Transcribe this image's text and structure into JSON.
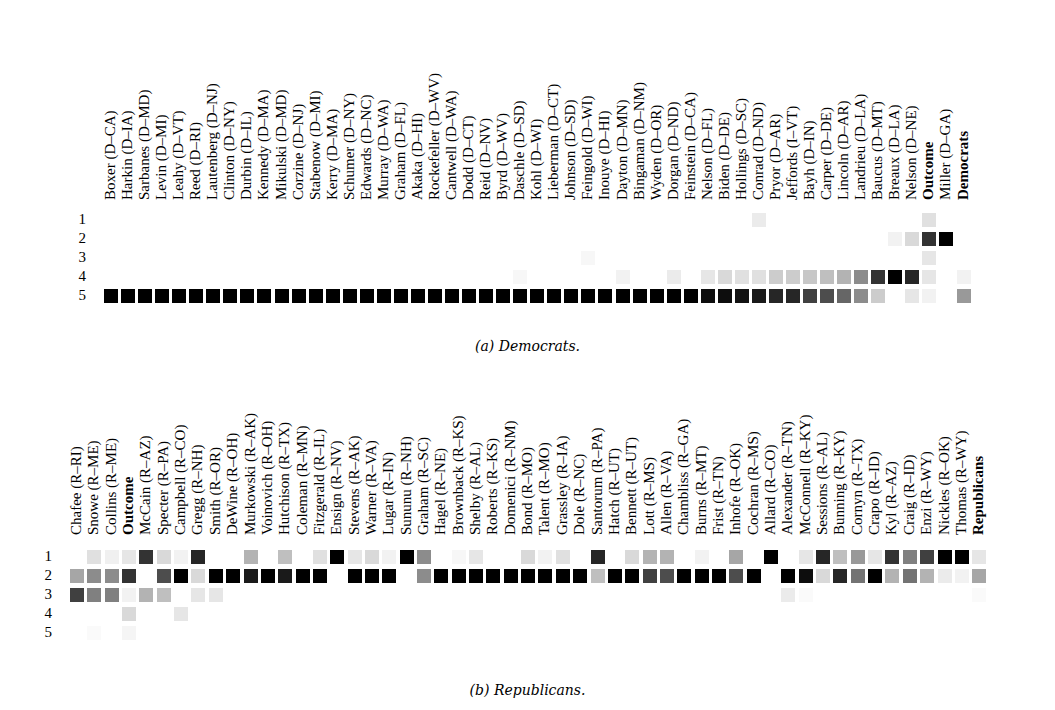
{
  "chart_data": [
    {
      "type": "heatmap",
      "title": "(a) Democrats.",
      "caption": "(a) Democrats.",
      "rows": [
        "1",
        "2",
        "3",
        "4",
        "5"
      ],
      "columns": [
        "Boxer (D–CA)",
        "Harkin (D–IA)",
        "Sarbanes (D–MD)",
        "Levin (D–MI)",
        "Leahy (D–VT)",
        "Reed (D–RI)",
        "Lautenberg (D–NJ)",
        "Clinton (D–NY)",
        "Durbin (D–IL)",
        "Kennedy (D–MA)",
        "Mikulski (D–MD)",
        "Corzine (D–NJ)",
        "Stabenow (D–MI)",
        "Kerry (D–MA)",
        "Schumer (D–NY)",
        "Edwards (D–NC)",
        "Murray (D–WA)",
        "Graham (D–FL)",
        "Akaka (D–HI)",
        "Rockefeller (D–WV)",
        "Cantwell (D–WA)",
        "Dodd (D–CT)",
        "Reid (D–NV)",
        "Byrd (D–WV)",
        "Daschle (D–SD)",
        "Kohl (D–WI)",
        "Lieberman (D–CT)",
        "Johnson (D–SD)",
        "Feingold (D–WI)",
        "Inouye (D–HI)",
        "Dayton (D–MN)",
        "Bingaman (D–NM)",
        "Wyden (D–OR)",
        "Dorgan (D–ND)",
        "Feinstein (D–CA)",
        "Nelson (D–FL)",
        "Biden (D–DE)",
        "Hollings (D–SC)",
        "Conrad (D–ND)",
        "Pryor (D–AR)",
        "Jeffords (I–VT)",
        "Bayh (D–IN)",
        "Carper (D–DE)",
        "Lincoln (D–AR)",
        "Landrieu (D–LA)",
        "Baucus (D–MT)",
        "Breaux (D–LA)",
        "Nelson (D–NE)",
        "Outcome",
        "Miller (D–GA)",
        "Democrats"
      ],
      "bold_columns": [
        "Outcome",
        "Democrats"
      ],
      "values_note": "intensity 0 (white) to 1 (black), rows 1..5",
      "values": [
        [
          0,
          0,
          0,
          0,
          0,
          0,
          0,
          0,
          0,
          0,
          0,
          0,
          0,
          0,
          0,
          0,
          0,
          0,
          0,
          0,
          0,
          0,
          0,
          0,
          0,
          0,
          0,
          0,
          0,
          0,
          0,
          0,
          0,
          0,
          0,
          0,
          0,
          0,
          0.08,
          0,
          0,
          0,
          0,
          0,
          0,
          0,
          0,
          0,
          0.12,
          0,
          0
        ],
        [
          0,
          0,
          0,
          0,
          0,
          0,
          0,
          0,
          0,
          0,
          0,
          0,
          0,
          0,
          0,
          0,
          0,
          0,
          0,
          0,
          0,
          0,
          0,
          0,
          0,
          0,
          0,
          0,
          0,
          0,
          0,
          0,
          0,
          0,
          0,
          0,
          0,
          0,
          0,
          0,
          0,
          0,
          0,
          0,
          0,
          0,
          0.05,
          0.15,
          0.8,
          1,
          0
        ],
        [
          0,
          0,
          0,
          0,
          0,
          0,
          0,
          0,
          0,
          0,
          0,
          0,
          0,
          0,
          0,
          0,
          0,
          0,
          0,
          0,
          0,
          0,
          0,
          0,
          0,
          0,
          0,
          0,
          0.03,
          0,
          0,
          0,
          0,
          0,
          0,
          0,
          0,
          0,
          0,
          0,
          0,
          0,
          0,
          0,
          0,
          0,
          0,
          0,
          0.1,
          0,
          0
        ],
        [
          0,
          0,
          0,
          0,
          0,
          0,
          0,
          0,
          0,
          0,
          0,
          0,
          0,
          0,
          0,
          0,
          0,
          0,
          0,
          0,
          0,
          0,
          0,
          0,
          0.03,
          0,
          0,
          0,
          0,
          0,
          0.05,
          0,
          0,
          0.08,
          0,
          0.1,
          0.15,
          0.12,
          0.12,
          0.2,
          0.2,
          0.22,
          0.25,
          0.3,
          0.45,
          0.8,
          1,
          0.85,
          0.1,
          0,
          0.05
        ],
        [
          1,
          1,
          1,
          1,
          1,
          1,
          1,
          1,
          1,
          1,
          1,
          1,
          1,
          1,
          1,
          1,
          1,
          1,
          1,
          1,
          1,
          1,
          1,
          1,
          1,
          1,
          1,
          1,
          1,
          1,
          1,
          1,
          1,
          1,
          1,
          0.95,
          0.95,
          0.93,
          0.9,
          0.85,
          0.85,
          0.75,
          0.7,
          0.6,
          0.45,
          0.2,
          0,
          0.1,
          0.05,
          0,
          0.4
        ]
      ]
    },
    {
      "type": "heatmap",
      "title": "(b) Republicans.",
      "caption": "(b) Republicans.",
      "rows": [
        "1",
        "2",
        "3",
        "4",
        "5"
      ],
      "columns": [
        "Chafee (R–RI)",
        "Snowe (R–ME)",
        "Collins (R–ME)",
        "Outcome",
        "McCain (R–AZ)",
        "Specter (R–PA)",
        "Campbell (R–CO)",
        "Gregg (R–NH)",
        "Smith (R–OR)",
        "DeWine (R–OH)",
        "Murkowski (R–AK)",
        "Voinovich (R–OH)",
        "Hutchison (R–TX)",
        "Coleman (R–MN)",
        "Fitzgerald (R–IL)",
        "Ensign (R–NV)",
        "Stevens (R–AK)",
        "Warner (R–VA)",
        "Lugar (R–IN)",
        "Sununu (R–NH)",
        "Graham (R–SC)",
        "Hagel (R–NE)",
        "Brownback (R–KS)",
        "Shelby (R–AL)",
        "Roberts (R–KS)",
        "Domenici (R–NM)",
        "Bond (R–MO)",
        "Talent (R–MO)",
        "Grassley (R–IA)",
        "Dole (R–NC)",
        "Santorum (R–PA)",
        "Hatch (R–UT)",
        "Bennett (R–UT)",
        "Lott (R–MS)",
        "Allen (R–VA)",
        "Chambliss (R–GA)",
        "Burns (R–MT)",
        "Frist (R–TN)",
        "Inhofe (R–OK)",
        "Cochran (R–MS)",
        "Allard (R–CO)",
        "Alexander (R–TN)",
        "McConnell (R–KY)",
        "Sessions (R–AL)",
        "Bunning (R–KY)",
        "Cornyn (R–TX)",
        "Crapo (R–ID)",
        "Kyl (R–AZ)",
        "Craig (R–ID)",
        "Enzi (R–WY)",
        "Nickles (R–OK)",
        "Thomas (R–WY)",
        "Republicans"
      ],
      "bold_columns": [
        "Outcome",
        "Republicans"
      ],
      "values_note": "intensity 0 (white) to 1 (black), rows 1..5",
      "values": [
        [
          0,
          0.12,
          0.06,
          0.1,
          0.8,
          0.15,
          0.05,
          0.85,
          0,
          0,
          0.3,
          0,
          0.25,
          0,
          0.12,
          1,
          0.1,
          0.15,
          0.05,
          1,
          0.45,
          0,
          0.03,
          0.1,
          0,
          0,
          0.15,
          0.05,
          0.12,
          0,
          0.85,
          0,
          0.15,
          0.3,
          0.3,
          0,
          0.05,
          0,
          0.35,
          0,
          1,
          0,
          0.1,
          0.85,
          0.25,
          0.4,
          0.1,
          0.8,
          0.5,
          0.75,
          1,
          1,
          0.1
        ],
        [
          0.35,
          0.45,
          0.45,
          0.8,
          0,
          0.7,
          1,
          0.15,
          1,
          1,
          0.9,
          1,
          0.9,
          1,
          1,
          0,
          1,
          1,
          1,
          0,
          0.45,
          1,
          1,
          1,
          1,
          1,
          1,
          1,
          1,
          1,
          0.25,
          1,
          1,
          0.75,
          0.7,
          1,
          1,
          1,
          0.7,
          1,
          0,
          1,
          0.95,
          0.15,
          0.85,
          0.55,
          1,
          0.3,
          0.55,
          0.3,
          0.08,
          0.05,
          0.35
        ],
        [
          0.75,
          0.5,
          0.5,
          0.05,
          0.3,
          0.25,
          0,
          0.1,
          0.1,
          0,
          0,
          0,
          0,
          0,
          0,
          0,
          0,
          0,
          0,
          0,
          0,
          0,
          0,
          0,
          0,
          0,
          0,
          0,
          0,
          0,
          0,
          0,
          0,
          0,
          0,
          0,
          0,
          0,
          0,
          0,
          0,
          0.08,
          0.02,
          0,
          0,
          0,
          0,
          0,
          0,
          0,
          0,
          0,
          0.02
        ],
        [
          0,
          0,
          0,
          0.15,
          0,
          0,
          0.1,
          0,
          0,
          0,
          0,
          0,
          0,
          0,
          0,
          0,
          0,
          0,
          0,
          0,
          0,
          0,
          0,
          0,
          0,
          0,
          0,
          0,
          0,
          0,
          0,
          0,
          0,
          0,
          0,
          0,
          0,
          0,
          0,
          0,
          0,
          0,
          0,
          0,
          0,
          0,
          0,
          0,
          0,
          0,
          0,
          0,
          0
        ],
        [
          0,
          0.02,
          0,
          0.04,
          0,
          0,
          0,
          0,
          0,
          0,
          0,
          0,
          0,
          0,
          0,
          0,
          0,
          0,
          0,
          0,
          0,
          0,
          0,
          0,
          0,
          0,
          0,
          0,
          0,
          0,
          0,
          0,
          0,
          0,
          0,
          0,
          0,
          0,
          0,
          0,
          0,
          0,
          0,
          0,
          0,
          0,
          0,
          0,
          0,
          0,
          0,
          0,
          0
        ]
      ]
    }
  ]
}
